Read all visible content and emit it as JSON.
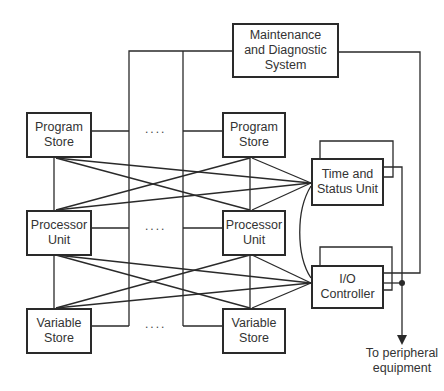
{
  "diagram": {
    "type": "block-diagram",
    "boxes": {
      "maintenance": {
        "line1": "Maintenance",
        "line2": "and Diagnostic",
        "line3": "System"
      },
      "program_store_left": {
        "line1": "Program",
        "line2": "Store"
      },
      "program_store_right": {
        "line1": "Program",
        "line2": "Store"
      },
      "processor_left": {
        "line1": "Processor",
        "line2": "Unit"
      },
      "processor_right": {
        "line1": "Processor",
        "line2": "Unit"
      },
      "variable_store_left": {
        "line1": "Variable",
        "line2": "Store"
      },
      "variable_store_right": {
        "line1": "Variable",
        "line2": "Store"
      },
      "time_status": {
        "line1": "Time and",
        "line2": "Status Unit"
      },
      "io_controller": {
        "line1": "I/O",
        "line2": "Controller"
      }
    },
    "ellipsis": "....",
    "output_label": {
      "line1": "To peripheral",
      "line2": "equipment"
    },
    "colors": {
      "line": "#2a2a2a",
      "background": "#ffffff"
    }
  }
}
